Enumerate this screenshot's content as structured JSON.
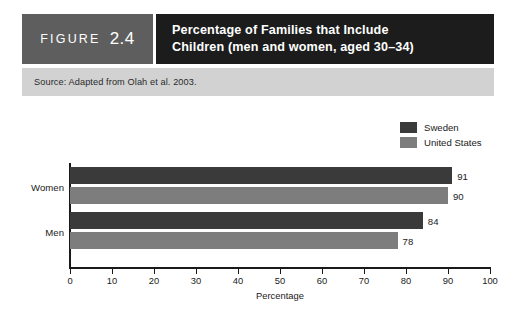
{
  "figure": {
    "label_word": "FIGURE",
    "number": "2.4",
    "title_line1": "Percentage of Families that Include",
    "title_line2": "Children (men and women, aged 30–34)",
    "source": "Source: Adapted from Olah et al. 2003."
  },
  "colors": {
    "figure_number_block": "#5e5e5e",
    "figure_title_block": "#1c1c1c",
    "source_band": "#d2d2d2",
    "sweden": "#3a3a3a",
    "united_states": "#7d7d7d",
    "axis": "#1a1a1a",
    "page_background": "#ffffff"
  },
  "chart_data": {
    "type": "bar",
    "orientation": "horizontal",
    "title": "Percentage of Families that Include Children (men and women, aged 30–34)",
    "xlabel": "Percentage",
    "ylabel": "",
    "categories": [
      "Women",
      "Men"
    ],
    "series": [
      {
        "name": "Sweden",
        "color": "#3a3a3a",
        "values": [
          91,
          84
        ]
      },
      {
        "name": "United States",
        "color": "#7d7d7d",
        "values": [
          90,
          78
        ]
      }
    ],
    "xlim": [
      0,
      100
    ],
    "xticks": [
      0,
      10,
      20,
      30,
      40,
      50,
      60,
      70,
      80,
      90,
      100
    ],
    "xtick_labels": [
      "0",
      "10",
      "20",
      "30",
      "40",
      "50",
      "60",
      "70",
      "80",
      "90",
      "100"
    ],
    "grid": false,
    "legend_position": "top-right",
    "data_labels": [
      {
        "category": "Women",
        "series": "Sweden",
        "value": 91,
        "label": "91"
      },
      {
        "category": "Women",
        "series": "United States",
        "value": 90,
        "label": "90"
      },
      {
        "category": "Men",
        "series": "Sweden",
        "value": 84,
        "label": "84"
      },
      {
        "category": "Men",
        "series": "United States",
        "value": 78,
        "label": "78"
      }
    ]
  }
}
